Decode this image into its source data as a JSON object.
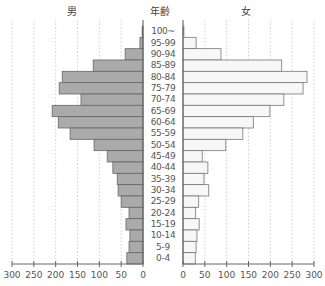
{
  "headers": {
    "male": "男",
    "age": "年齢",
    "female": "女"
  },
  "chart_data": {
    "type": "bar",
    "subtype": "population-pyramid",
    "title": "",
    "categories": [
      "100~",
      "95-99",
      "90-94",
      "85-89",
      "80-84",
      "75-79",
      "70-74",
      "65-69",
      "60-64",
      "55-59",
      "50-54",
      "45-49",
      "40-44",
      "35-39",
      "30-34",
      "25-29",
      "20-24",
      "15-19",
      "10-14",
      "5-9",
      "0-4"
    ],
    "series": [
      {
        "name": "男",
        "side": "left",
        "color": "#aaaaaa",
        "values": [
          2,
          7,
          41,
          114,
          185,
          192,
          142,
          208,
          194,
          167,
          112,
          82,
          69,
          59,
          57,
          50,
          32,
          39,
          30,
          32,
          37
        ]
      },
      {
        "name": "女",
        "side": "right",
        "color": "#f7f7f7",
        "values": [
          2,
          30,
          87,
          226,
          284,
          275,
          231,
          199,
          161,
          137,
          98,
          44,
          57,
          48,
          59,
          36,
          29,
          37,
          32,
          30,
          28
        ]
      }
    ],
    "xlabel": "",
    "ylabel": "年齢",
    "x_ticks": [
      0,
      50,
      100,
      150,
      200,
      250,
      300
    ],
    "xlim": [
      0,
      300
    ],
    "grid": "vertical dotted"
  }
}
